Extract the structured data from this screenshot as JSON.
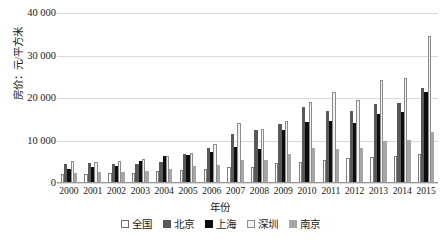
{
  "chart_data": {
    "type": "bar",
    "title": "",
    "xlabel": "年份",
    "ylabel": "房价：元/平方米",
    "categories": [
      "2000",
      "2001",
      "2002",
      "2003",
      "2004",
      "2005",
      "2006",
      "2007",
      "2008",
      "2009",
      "2010",
      "2011",
      "2012",
      "2013",
      "2014",
      "2015"
    ],
    "ylim": [
      0,
      40000
    ],
    "yticks": [
      0,
      10000,
      20000,
      30000,
      40000
    ],
    "ytick_labels": [
      "0",
      "10 000",
      "20 000",
      "30 000",
      "40 000"
    ],
    "grid": true,
    "legend_position": "bottom",
    "series": [
      {
        "name": "全国",
        "color": "#ffffff",
        "values": [
          2112,
          2170,
          2250,
          2359,
          2778,
          3168,
          3367,
          3864,
          3800,
          4681,
          5032,
          5357,
          5791,
          6237,
          6324,
          6793
        ]
      },
      {
        "name": "北京",
        "color": "#595959",
        "values": [
          4557,
          4716,
          4467,
          4456,
          5053,
          6788,
          8280,
          11553,
          12418,
          13799,
          17782,
          16852,
          17022,
          18553,
          18833,
          22300
        ]
      },
      {
        "name": "上海",
        "color": "#0d0d0d",
        "values": [
          3326,
          3659,
          4007,
          5118,
          6385,
          6698,
          7196,
          8361,
          8115,
          12364,
          14464,
          14603,
          14061,
          16192,
          16787,
          21501
        ]
      },
      {
        "name": "深圳",
        "color": "#f2f2f2",
        "values": [
          5105,
          5006,
          5267,
          5680,
          6385,
          6996,
          9230,
          14050,
          12665,
          14615,
          19170,
          21350,
          19583,
          24352,
          24723,
          34600
        ]
      },
      {
        "name": "南京",
        "color": "#a6a6a6",
        "values": [
          2274,
          2493,
          2610,
          2831,
          3231,
          3916,
          4283,
          5400,
          5389,
          6744,
          8262,
          8119,
          8269,
          9890,
          10092,
          11981
        ]
      }
    ]
  }
}
